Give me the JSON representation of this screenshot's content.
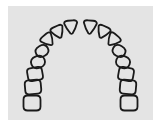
{
  "diagram": {
    "title": "",
    "tooth_count": 16,
    "teeth": [
      {
        "id": "L8",
        "side": "left",
        "type": "molar"
      },
      {
        "id": "L7",
        "side": "left",
        "type": "molar"
      },
      {
        "id": "L6",
        "side": "left",
        "type": "molar"
      },
      {
        "id": "L5",
        "side": "left",
        "type": "premolar"
      },
      {
        "id": "L4",
        "side": "left",
        "type": "premolar"
      },
      {
        "id": "L3",
        "side": "left",
        "type": "canine"
      },
      {
        "id": "L2",
        "side": "left",
        "type": "incisor"
      },
      {
        "id": "L1",
        "side": "left",
        "type": "incisor"
      },
      {
        "id": "R1",
        "side": "right",
        "type": "incisor"
      },
      {
        "id": "R2",
        "side": "right",
        "type": "incisor"
      },
      {
        "id": "R3",
        "side": "right",
        "type": "canine"
      },
      {
        "id": "R4",
        "side": "right",
        "type": "premolar"
      },
      {
        "id": "R5",
        "side": "right",
        "type": "premolar"
      },
      {
        "id": "R6",
        "side": "right",
        "type": "molar"
      },
      {
        "id": "R7",
        "side": "right",
        "type": "molar"
      },
      {
        "id": "R8",
        "side": "right",
        "type": "molar"
      }
    ],
    "colors": {
      "background": "#e4e4e4",
      "outline": "#1a1a1a",
      "page": "#ffffff"
    }
  }
}
